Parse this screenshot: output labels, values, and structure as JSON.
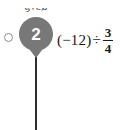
{
  "step_marker": {
    "caption": "STEP",
    "number": "2",
    "marker_color": "#787878",
    "number_color": "#ffffff",
    "caption_color": "#5b5b5b"
  },
  "selector": {
    "state": "unselected",
    "outline_color": "#8a8a8a"
  },
  "timeline": {
    "line_color": "#2e2e2e"
  },
  "expression": {
    "full_text": "(−12) ÷ 3/4",
    "open_paren": "(",
    "signed_number": "−12",
    "close_paren": ")",
    "operator": "÷",
    "fraction": {
      "numerator": "3",
      "denominator": "4"
    },
    "text_color": "#1a1a1a"
  },
  "canvas": {
    "background": "#ffffff",
    "width": "126",
    "height": "130"
  }
}
